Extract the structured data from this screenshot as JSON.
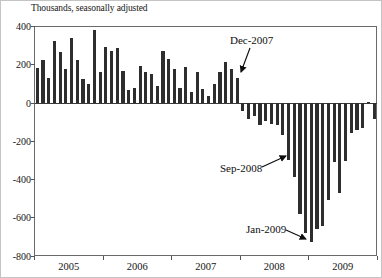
{
  "chart_data": {
    "type": "bar",
    "title": "Thousands, seasonally adjusted",
    "xlabel": "",
    "ylabel": "Thousands",
    "ylim": [
      -800,
      400
    ],
    "y_ticks": [
      400,
      200,
      0,
      -200,
      -400,
      -600,
      -800
    ],
    "grid": false,
    "legend": "none",
    "bar_color": "#2e2e2e",
    "years": [
      "2005",
      "2006",
      "2007",
      "2008",
      "2009"
    ],
    "series": [
      {
        "name": "one-month net change in nonfarm employment",
        "values": [
          185,
          225,
          130,
          325,
          265,
          180,
          340,
          225,
          125,
          100,
          380,
          160,
          295,
          270,
          285,
          165,
          70,
          80,
          195,
          160,
          150,
          90,
          270,
          230,
          180,
          80,
          190,
          60,
          160,
          75,
          35,
          100,
          160,
          215,
          180,
          130,
          -40,
          -85,
          -70,
          -115,
          -95,
          -110,
          -115,
          -165,
          -300,
          -385,
          -580,
          -680,
          -725,
          -660,
          -645,
          -505,
          -310,
          -470,
          -305,
          -155,
          -140,
          -130,
          5,
          -85
        ]
      }
    ],
    "annotations": [
      {
        "label": "Dec-2007",
        "month_index": 35,
        "text_x": 229,
        "text_y": 33,
        "arrow": {
          "x1": 249,
          "y1": 47,
          "x2": 240,
          "y2": 71
        }
      },
      {
        "label": "Sep-2008",
        "month_index": 44,
        "text_x": 219,
        "text_y": 161,
        "arrow": {
          "x1": 261,
          "y1": 166,
          "x2": 285,
          "y2": 155
        }
      },
      {
        "label": "Jan-2009",
        "month_index": 48,
        "text_x": 245,
        "text_y": 222,
        "arrow": {
          "x1": 285,
          "y1": 229,
          "x2": 305,
          "y2": 238
        }
      }
    ]
  }
}
